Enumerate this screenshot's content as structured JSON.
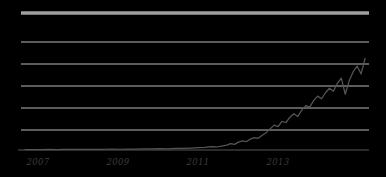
{
  "chart_data": {
    "type": "line",
    "title": "",
    "subtitle": "",
    "xlabel": "",
    "ylabel": "",
    "grid": true,
    "legend": "none",
    "xlim": [
      2005.7,
      2014.5
    ],
    "ylim": [
      0,
      6
    ],
    "x_ticks": [
      2007,
      2009,
      2011,
      2013
    ],
    "x_tick_labels": [
      "2007",
      "2009",
      "2011",
      "2013"
    ],
    "y_ticks": [
      0,
      1,
      2,
      3,
      4,
      5,
      6
    ],
    "y_tick_labels": [
      "",
      "",
      "",
      "",
      "",
      "",
      ""
    ],
    "colors": {
      "line": "#555555",
      "grid": "#cccccc",
      "axis": "#3a3a3a",
      "top_rule": "#9e9e9e",
      "background": "#ffffff"
    },
    "series": [
      {
        "name": "value",
        "x": [
          2005.8,
          2006.0,
          2006.2,
          2006.4,
          2006.6,
          2006.8,
          2007.0,
          2007.2,
          2007.4,
          2007.6,
          2007.8,
          2008.0,
          2008.2,
          2008.4,
          2008.6,
          2008.8,
          2009.0,
          2009.2,
          2009.4,
          2009.6,
          2009.8,
          2010.0,
          2010.2,
          2010.35,
          2010.5,
          2010.65,
          2010.8,
          2010.9,
          2011.0,
          2011.1,
          2011.2,
          2011.3,
          2011.4,
          2011.5,
          2011.6,
          2011.7,
          2011.8,
          2011.9,
          2012.0,
          2012.1,
          2012.2,
          2012.3,
          2012.4,
          2012.5,
          2012.6,
          2012.7,
          2012.8,
          2012.9,
          2013.0,
          2013.1,
          2013.2,
          2013.3,
          2013.4,
          2013.5,
          2013.6,
          2013.7,
          2013.8,
          2013.9,
          2014.0,
          2014.1,
          2014.2,
          2014.3,
          2014.4
        ],
        "y": [
          0.02,
          0.02,
          0.02,
          0.03,
          0.02,
          0.03,
          0.03,
          0.04,
          0.03,
          0.04,
          0.04,
          0.05,
          0.04,
          0.05,
          0.05,
          0.06,
          0.06,
          0.07,
          0.06,
          0.08,
          0.08,
          0.1,
          0.12,
          0.14,
          0.18,
          0.16,
          0.22,
          0.26,
          0.34,
          0.3,
          0.42,
          0.48,
          0.44,
          0.58,
          0.66,
          0.62,
          0.78,
          0.92,
          1.12,
          1.32,
          1.24,
          1.52,
          1.46,
          1.74,
          1.92,
          1.78,
          2.12,
          2.36,
          2.28,
          2.62,
          2.86,
          2.72,
          3.04,
          3.28,
          3.12,
          3.54,
          3.82,
          2.96,
          3.68,
          4.16,
          4.46,
          4.04,
          4.86
        ]
      }
    ]
  },
  "axis": {
    "tick_labels": [
      {
        "text": "2007",
        "x": 38
      },
      {
        "text": "2009",
        "x": 118
      },
      {
        "text": "2011",
        "x": 198
      },
      {
        "text": "2013",
        "x": 278
      }
    ]
  }
}
